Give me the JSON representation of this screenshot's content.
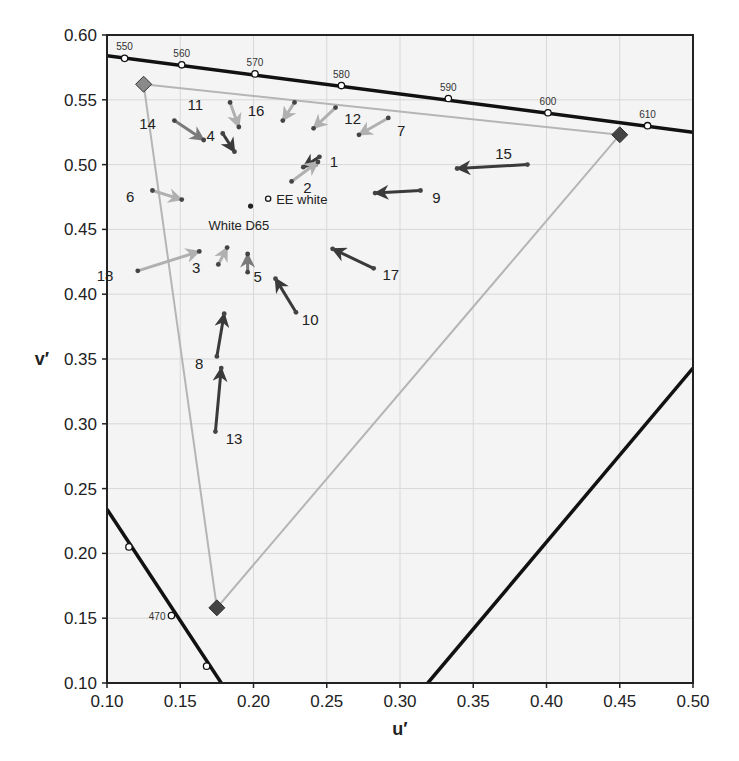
{
  "chart_data": {
    "type": "scatter",
    "title": "",
    "xlabel": "u′",
    "ylabel": "v′",
    "xlim": [
      0.1,
      0.5
    ],
    "ylim": [
      0.1,
      0.6
    ],
    "grid": true,
    "x_ticks": [
      "0.10",
      "0.15",
      "0.20",
      "0.25",
      "0.30",
      "0.35",
      "0.40",
      "0.45",
      "0.50"
    ],
    "y_ticks": [
      "0.10",
      "0.15",
      "0.20",
      "0.25",
      "0.30",
      "0.35",
      "0.40",
      "0.45",
      "0.50",
      "0.55",
      "0.60"
    ],
    "spectral_locus_top": {
      "line": [
        [
          0.1,
          0.584
        ],
        [
          0.5,
          0.525
        ]
      ],
      "markers": [
        {
          "nm": "550",
          "u": 0.112,
          "v": 0.582
        },
        {
          "nm": "560",
          "u": 0.151,
          "v": 0.577
        },
        {
          "nm": "570",
          "u": 0.201,
          "v": 0.57
        },
        {
          "nm": "580",
          "u": 0.26,
          "v": 0.561
        },
        {
          "nm": "590",
          "u": 0.333,
          "v": 0.551
        },
        {
          "nm": "600",
          "u": 0.401,
          "v": 0.54
        },
        {
          "nm": "610",
          "u": 0.469,
          "v": 0.53
        }
      ]
    },
    "spectral_locus_blue": {
      "line": [
        [
          0.1,
          0.234
        ],
        [
          0.178,
          0.1
        ]
      ],
      "markers": [
        {
          "nm": "",
          "u": 0.115,
          "v": 0.205
        },
        {
          "nm": "470",
          "u": 0.144,
          "v": 0.152
        },
        {
          "nm": "",
          "u": 0.168,
          "v": 0.113
        }
      ]
    },
    "purple_line": [
      [
        0.319,
        0.1
      ],
      [
        0.5,
        0.343
      ]
    ],
    "gamut_triangle": {
      "green": {
        "u": 0.125,
        "v": 0.562,
        "color": "#8a8a8a"
      },
      "red": {
        "u": 0.45,
        "v": 0.523,
        "color": "#444444"
      },
      "blue": {
        "u": 0.175,
        "v": 0.158,
        "color": "#444444"
      },
      "edge_color": "#b5b5b5"
    },
    "reference_points": [
      {
        "label": "EE white",
        "u": 0.21,
        "v": 0.4737,
        "style": "open"
      },
      {
        "label": "White D65",
        "u": 0.198,
        "v": 0.468,
        "style": "filled"
      }
    ],
    "arrows": [
      {
        "id": "1",
        "from": [
          0.245,
          0.506
        ],
        "to": [
          0.234,
          0.498
        ],
        "tone": "dark",
        "label_at": [
          0.252,
          0.502
        ]
      },
      {
        "id": "2",
        "from": [
          0.226,
          0.487
        ],
        "to": [
          0.244,
          0.502
        ],
        "tone": "light",
        "label_at": [
          0.234,
          0.482
        ]
      },
      {
        "id": "3",
        "from": [
          0.176,
          0.423
        ],
        "to": [
          0.182,
          0.436
        ],
        "tone": "light",
        "label_at": [
          0.158,
          0.42
        ]
      },
      {
        "id": "4",
        "from": [
          0.179,
          0.524
        ],
        "to": [
          0.187,
          0.51
        ],
        "tone": "dark",
        "label_at": [
          0.168,
          0.522
        ]
      },
      {
        "id": "5",
        "from": [
          0.196,
          0.417
        ],
        "to": [
          0.196,
          0.431
        ],
        "tone": "medium",
        "label_at": [
          0.2,
          0.413
        ]
      },
      {
        "id": "6",
        "from": [
          0.131,
          0.48
        ],
        "to": [
          0.151,
          0.473
        ],
        "tone": "light",
        "label_at": [
          0.113,
          0.475
        ]
      },
      {
        "id": "7",
        "from": [
          0.292,
          0.536
        ],
        "to": [
          0.272,
          0.523
        ],
        "tone": "light",
        "label_at": [
          0.298,
          0.526
        ]
      },
      {
        "id": "8",
        "from": [
          0.175,
          0.352
        ],
        "to": [
          0.18,
          0.385
        ],
        "tone": "dark",
        "label_at": [
          0.16,
          0.346
        ]
      },
      {
        "id": "9",
        "from": [
          0.314,
          0.48
        ],
        "to": [
          0.283,
          0.478
        ],
        "tone": "dark",
        "label_at": [
          0.322,
          0.474
        ]
      },
      {
        "id": "10",
        "from": [
          0.229,
          0.386
        ],
        "to": [
          0.215,
          0.412
        ],
        "tone": "dark",
        "label_at": [
          0.233,
          0.38
        ]
      },
      {
        "id": "11",
        "from": [
          0.184,
          0.548
        ],
        "to": [
          0.19,
          0.529
        ],
        "tone": "light",
        "label_at": [
          0.155,
          0.546
        ]
      },
      {
        "id": "12",
        "from": [
          0.256,
          0.544
        ],
        "to": [
          0.241,
          0.528
        ],
        "tone": "light",
        "label_at": [
          0.262,
          0.535
        ]
      },
      {
        "id": "13",
        "from": [
          0.174,
          0.294
        ],
        "to": [
          0.178,
          0.343
        ],
        "tone": "dark",
        "label_at": [
          0.181,
          0.288
        ]
      },
      {
        "id": "14",
        "from": [
          0.146,
          0.534
        ],
        "to": [
          0.166,
          0.519
        ],
        "tone": "medium",
        "label_at": [
          0.122,
          0.531
        ]
      },
      {
        "id": "15",
        "from": [
          0.387,
          0.5
        ],
        "to": [
          0.339,
          0.497
        ],
        "tone": "dark",
        "label_at": [
          0.365,
          0.508
        ]
      },
      {
        "id": "16",
        "from": [
          0.228,
          0.548
        ],
        "to": [
          0.22,
          0.534
        ],
        "tone": "light",
        "label_at": [
          0.196,
          0.541
        ]
      },
      {
        "id": "17",
        "from": [
          0.282,
          0.42
        ],
        "to": [
          0.254,
          0.435
        ],
        "tone": "dark",
        "label_at": [
          0.288,
          0.415
        ]
      },
      {
        "id": "18",
        "from": [
          0.121,
          0.418
        ],
        "to": [
          0.163,
          0.433
        ],
        "tone": "light",
        "label_at": [
          0.093,
          0.414
        ]
      }
    ],
    "tone_colors": {
      "dark": "#3a3a3a",
      "medium": "#7a7a7a",
      "light": "#b0b0b0"
    }
  }
}
